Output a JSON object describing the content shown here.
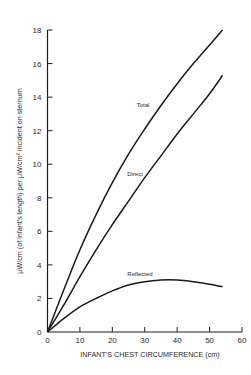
{
  "chart_data": {
    "type": "line",
    "title": "",
    "xlabel": "INFANT'S CHEST CIRCUMFERENCE (cm)",
    "ylabel": "μW/cm (of infant's length) per μW/cm² incident on sternum",
    "xlim": [
      0,
      60
    ],
    "ylim": [
      0,
      18
    ],
    "xticks": [
      0,
      10,
      20,
      30,
      40,
      50,
      60
    ],
    "yticks": [
      0,
      2,
      4,
      6,
      8,
      10,
      12,
      14,
      16,
      18
    ],
    "grid": false,
    "legend": "inline labels",
    "series": [
      {
        "name": "Total",
        "x": [
          0,
          5,
          10,
          15,
          20,
          25,
          30,
          35,
          40,
          45,
          50,
          54
        ],
        "y": [
          0,
          2.5,
          4.9,
          7.0,
          8.9,
          10.6,
          12.1,
          13.5,
          14.8,
          16.0,
          17.1,
          18.0
        ]
      },
      {
        "name": "Direct",
        "x": [
          0,
          5,
          10,
          15,
          20,
          25,
          30,
          35,
          40,
          45,
          50,
          54
        ],
        "y": [
          0,
          1.6,
          3.3,
          4.9,
          6.4,
          7.8,
          9.2,
          10.5,
          11.8,
          13.0,
          14.2,
          15.3
        ]
      },
      {
        "name": "Reflected",
        "x": [
          0,
          5,
          10,
          15,
          20,
          25,
          30,
          35,
          40,
          45,
          50,
          54
        ],
        "y": [
          0,
          0.8,
          1.5,
          2.0,
          2.45,
          2.8,
          3.0,
          3.1,
          3.1,
          3.0,
          2.85,
          2.7
        ]
      }
    ],
    "annotations": [
      {
        "text": "Total",
        "series": "Total"
      },
      {
        "text": "Direct",
        "series": "Direct"
      },
      {
        "text": "Reflected",
        "series": "Reflected"
      }
    ]
  }
}
